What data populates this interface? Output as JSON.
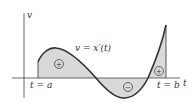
{
  "diagram": {
    "curve_label": "v = x′(t)",
    "y_axis_label": "v",
    "x_axis_label": "t",
    "left_bound_label": "t = a",
    "right_bound_label": "t = b",
    "regions": [
      {
        "sign": "+",
        "description": "area above axis, left"
      },
      {
        "sign": "−",
        "description": "area below axis, middle"
      },
      {
        "sign": "+",
        "description": "area above axis, right"
      }
    ],
    "colors": {
      "fill": "#d9d9d9",
      "curve": "#333333",
      "axis": "#444444"
    }
  }
}
